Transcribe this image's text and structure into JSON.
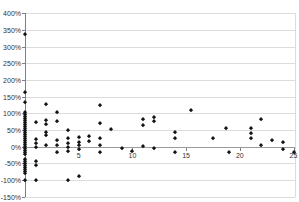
{
  "chart_data": {
    "type": "scatter",
    "title_fragment": "j...",
    "xlabel": "",
    "ylabel": "",
    "xlim": [
      0,
      25
    ],
    "ylim": [
      -150,
      400
    ],
    "grid": true,
    "legend": "none",
    "marker": "diamond",
    "marker_color": "#141414",
    "gridline_color": "#dcdcdc",
    "zero_line_color": "#9b9b9b",
    "axis_color": "#7f7f7f",
    "y_tick_values": [
      400,
      350,
      300,
      250,
      200,
      150,
      100,
      50,
      0,
      -50,
      -100,
      -150
    ],
    "y_tick_labels": [
      "400%",
      "350%",
      "300%",
      "250%",
      "200%",
      "150%",
      "100%",
      "50%",
      "0%",
      "-50%",
      "-100%",
      "-150%"
    ],
    "x_tick_values": [
      5,
      10,
      15,
      20,
      25
    ],
    "x_tick_labels": [
      "5",
      "10",
      "15",
      "20",
      "25"
    ],
    "points": [
      [
        0,
        338
      ],
      [
        0,
        165
      ],
      [
        0,
        133
      ],
      [
        0,
        105
      ],
      [
        0,
        98
      ],
      [
        0,
        92
      ],
      [
        0,
        86
      ],
      [
        0,
        80
      ],
      [
        0,
        74
      ],
      [
        0,
        68
      ],
      [
        0,
        62
      ],
      [
        0,
        56
      ],
      [
        0,
        50
      ],
      [
        0,
        44
      ],
      [
        0,
        38
      ],
      [
        0,
        32
      ],
      [
        0,
        26
      ],
      [
        0,
        20
      ],
      [
        0,
        14
      ],
      [
        0,
        8
      ],
      [
        0,
        2
      ],
      [
        0,
        -4
      ],
      [
        0,
        -10
      ],
      [
        0,
        -16
      ],
      [
        0,
        -22
      ],
      [
        0,
        -36
      ],
      [
        0,
        -42
      ],
      [
        0,
        -48
      ],
      [
        0,
        -54
      ],
      [
        0,
        -60
      ],
      [
        0,
        -66
      ],
      [
        0,
        -72
      ],
      [
        0,
        -78
      ],
      [
        0,
        -100
      ],
      [
        1,
        74
      ],
      [
        1,
        23
      ],
      [
        1,
        11
      ],
      [
        1,
        -1
      ],
      [
        1,
        -44
      ],
      [
        1,
        -56
      ],
      [
        1,
        -100
      ],
      [
        2,
        128
      ],
      [
        2,
        80
      ],
      [
        2,
        68
      ],
      [
        2,
        44
      ],
      [
        2,
        35
      ],
      [
        2,
        5
      ],
      [
        3,
        103
      ],
      [
        3,
        77
      ],
      [
        3,
        20
      ],
      [
        3,
        5
      ],
      [
        3,
        -17
      ],
      [
        4,
        50
      ],
      [
        4,
        25
      ],
      [
        4,
        12
      ],
      [
        4,
        0
      ],
      [
        4,
        -12
      ],
      [
        4,
        -100
      ],
      [
        5,
        28
      ],
      [
        5,
        15
      ],
      [
        5,
        5
      ],
      [
        5,
        -8
      ],
      [
        5,
        -88
      ],
      [
        6,
        33
      ],
      [
        6,
        18
      ],
      [
        7,
        125
      ],
      [
        7,
        70
      ],
      [
        7,
        26
      ],
      [
        7,
        5
      ],
      [
        7,
        -17
      ],
      [
        8,
        52
      ],
      [
        9,
        -5
      ],
      [
        10,
        -14
      ],
      [
        11,
        82
      ],
      [
        11,
        65
      ],
      [
        11,
        2
      ],
      [
        12,
        88
      ],
      [
        12,
        78
      ],
      [
        12,
        -5
      ],
      [
        14,
        44
      ],
      [
        14,
        26
      ],
      [
        14,
        -17
      ],
      [
        15.5,
        110
      ],
      [
        17.5,
        26
      ],
      [
        18.7,
        55
      ],
      [
        19,
        -17
      ],
      [
        21,
        55
      ],
      [
        21,
        40
      ],
      [
        21,
        26
      ],
      [
        22,
        82
      ],
      [
        22,
        5
      ],
      [
        23,
        20
      ],
      [
        24,
        15
      ],
      [
        24,
        -8
      ],
      [
        25,
        -15
      ]
    ]
  }
}
